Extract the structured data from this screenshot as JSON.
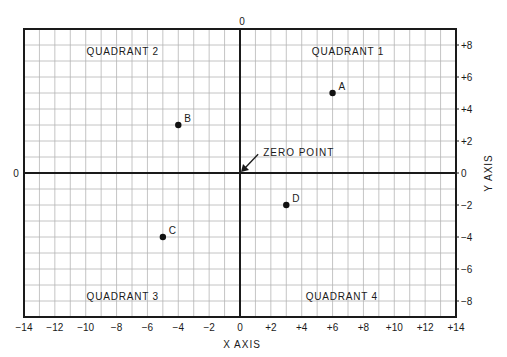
{
  "chart_data": {
    "type": "scatter",
    "title": "",
    "xlabel": "X AXIS",
    "ylabel": "Y AXIS",
    "xlim": [
      -14,
      14
    ],
    "ylim": [
      -9,
      9
    ],
    "grid": true,
    "x_ticks": [
      {
        "value": -14,
        "label": "−14"
      },
      {
        "value": -12,
        "label": "−12"
      },
      {
        "value": -10,
        "label": "−10"
      },
      {
        "value": -8,
        "label": "−8"
      },
      {
        "value": -6,
        "label": "−6"
      },
      {
        "value": -4,
        "label": "−4"
      },
      {
        "value": -2,
        "label": "−2"
      },
      {
        "value": 0,
        "label": "0"
      },
      {
        "value": 2,
        "label": "+2"
      },
      {
        "value": 4,
        "label": "+4"
      },
      {
        "value": 6,
        "label": "+6"
      },
      {
        "value": 8,
        "label": "+8"
      },
      {
        "value": 10,
        "label": "+10"
      },
      {
        "value": 12,
        "label": "+12"
      },
      {
        "value": 14,
        "label": "+14"
      }
    ],
    "y_ticks": [
      {
        "value": 8,
        "label": "+8"
      },
      {
        "value": 6,
        "label": "+6"
      },
      {
        "value": 4,
        "label": "+4"
      },
      {
        "value": 2,
        "label": "+2"
      },
      {
        "value": 0,
        "label": "0"
      },
      {
        "value": -2,
        "label": "−2"
      },
      {
        "value": -4,
        "label": "−4"
      },
      {
        "value": -6,
        "label": "−6"
      },
      {
        "value": -8,
        "label": "−8"
      }
    ],
    "axis_zero_labels": {
      "top": "0",
      "left": "0"
    },
    "points": [
      {
        "label": "A",
        "x": 6,
        "y": 5
      },
      {
        "label": "B",
        "x": -4,
        "y": 3
      },
      {
        "label": "C",
        "x": -5,
        "y": -4
      },
      {
        "label": "D",
        "x": 3,
        "y": -2
      }
    ],
    "annotations": [
      {
        "text": "QUADRANT 1",
        "x": 7,
        "y": 7.6
      },
      {
        "text": "QUADRANT 2",
        "x": -7.6,
        "y": 7.6
      },
      {
        "text": "QUADRANT 3",
        "x": -7.6,
        "y": -7.7
      },
      {
        "text": "QUADRANT 4",
        "x": 6.6,
        "y": -7.7
      },
      {
        "text": "ZERO POINT",
        "x": 1.5,
        "y": 1.3,
        "arrow_to": [
          0,
          0
        ]
      }
    ]
  },
  "colors": {
    "grid": "#b5b5b5",
    "axis": "#1a1a1a",
    "point": "#111111",
    "background": "#ffffff"
  }
}
